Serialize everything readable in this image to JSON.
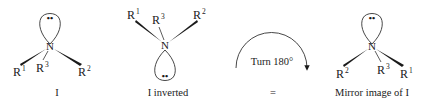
{
  "figure": {
    "structures": [
      {
        "id": "I",
        "caption": "I",
        "center_atom": "N",
        "substituents": [
          {
            "base": "R",
            "index": "1"
          },
          {
            "base": "R",
            "index": "3"
          },
          {
            "base": "R",
            "index": "2"
          }
        ],
        "lone_pair": "••"
      },
      {
        "id": "I-inverted",
        "caption": "I inverted",
        "center_atom": "N",
        "substituents": [
          {
            "base": "R",
            "index": "1"
          },
          {
            "base": "R",
            "index": "3"
          },
          {
            "base": "R",
            "index": "2"
          }
        ],
        "lone_pair": "••"
      },
      {
        "id": "mirror-I",
        "caption": "Mirror image of I",
        "center_atom": "N",
        "substituents": [
          {
            "base": "R",
            "index": "2"
          },
          {
            "base": "R",
            "index": "3"
          },
          {
            "base": "R",
            "index": "1"
          }
        ],
        "lone_pair": "••"
      }
    ],
    "rotation": {
      "label": "Turn 180°",
      "equals": "="
    }
  }
}
